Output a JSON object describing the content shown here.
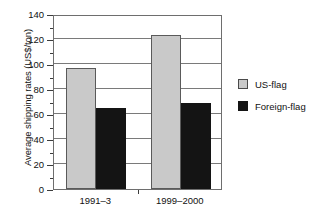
{
  "chart_data": {
    "type": "bar",
    "title": "",
    "xlabel": "",
    "ylabel": "Average shipping rates (US$/ton)",
    "categories": [
      "1991–3",
      "1999–2000"
    ],
    "series": [
      {
        "name": "US-flag",
        "color": "#c9c9c9",
        "values": [
          97,
          123
        ]
      },
      {
        "name": "Foreign-flag",
        "color": "#141414",
        "values": [
          65,
          69
        ]
      }
    ],
    "ylim": [
      0,
      140
    ],
    "ytick_labels": [
      "0",
      "20",
      "40",
      "60",
      "80",
      "100",
      "120",
      "140"
    ],
    "ytick_values": [
      0,
      20,
      40,
      60,
      80,
      100,
      120,
      140
    ],
    "yminor_step": 10,
    "grid": "horizontal",
    "legend_position": "right"
  },
  "legend": {
    "entries": [
      {
        "label": "US-flag",
        "swatch": "us-flag-swatch"
      },
      {
        "label": "Foreign-flag",
        "swatch": "foreign-flag-swatch"
      }
    ]
  }
}
